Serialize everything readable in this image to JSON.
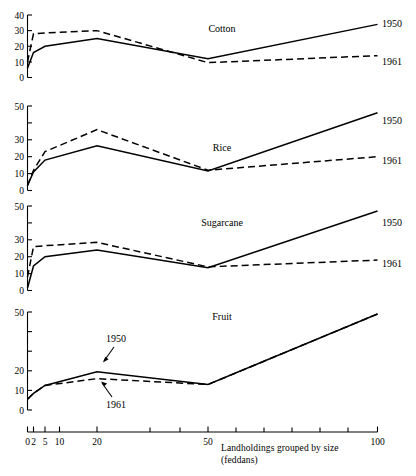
{
  "chart_data": {
    "type": "line",
    "title": "",
    "xlabel": "Landholdings grouped by size (feddans)",
    "ylabel": "",
    "x_scale": "ordinal-log",
    "grid": false,
    "legend_position": "right-end-of-line",
    "x_ticks": [
      "0",
      "2",
      "5",
      "10",
      "20",
      "50",
      "100"
    ],
    "x_tick_values": [
      0,
      2,
      5,
      10,
      20,
      50,
      100
    ],
    "panels": [
      {
        "name": "cotton",
        "title": "Cotton",
        "ylim": [
          0,
          40
        ],
        "y_ticks": [
          0,
          10,
          20,
          30,
          40
        ],
        "y_tick_labels": [
          "0",
          "10",
          "20",
          "30",
          "40"
        ],
        "x": [
          0,
          2,
          5,
          20,
          50,
          100
        ],
        "series": [
          {
            "name": "1950",
            "style": "solid",
            "label": "1950",
            "values": [
              6,
              16,
              20,
              25,
              12,
              34
            ]
          },
          {
            "name": "1961",
            "style": "dashed",
            "label": "1961",
            "values": [
              10,
              28,
              28.5,
              30,
              9.5,
              14
            ]
          }
        ]
      },
      {
        "name": "rice",
        "title": "Rice",
        "ylim": [
          0,
          50
        ],
        "y_ticks": [
          0,
          10,
          20,
          30,
          40,
          50
        ],
        "y_tick_labels": [
          "0",
          "10",
          "20",
          "30",
          "",
          "50"
        ],
        "x": [
          0,
          2,
          5,
          20,
          50,
          100
        ],
        "series": [
          {
            "name": "1950",
            "style": "solid",
            "label": "1950",
            "values": [
              3,
              11,
              18,
              26.5,
              11.5,
              46
            ]
          },
          {
            "name": "1961",
            "style": "dashed",
            "label": "1961",
            "values": [
              3,
              12,
              23,
              36,
              12,
              20
            ]
          }
        ]
      },
      {
        "name": "sugarcane",
        "title": "Sugarcane",
        "ylim": [
          0,
          50
        ],
        "y_ticks": [
          0,
          10,
          20,
          30,
          40,
          50
        ],
        "y_tick_labels": [
          "0",
          "10",
          "20",
          "30",
          "",
          "50"
        ],
        "x": [
          0,
          2,
          5,
          20,
          50,
          100
        ],
        "series": [
          {
            "name": "1950",
            "style": "solid",
            "label": "1950",
            "values": [
              1.5,
              14.5,
              20,
              24,
              13.5,
              47
            ]
          },
          {
            "name": "1961",
            "style": "dashed",
            "label": "1961",
            "values": [
              8,
              26,
              26.5,
              28.5,
              14,
              18
            ]
          }
        ]
      },
      {
        "name": "fruit",
        "title": "Fruit",
        "ylim": [
          0,
          50
        ],
        "y_ticks": [
          0,
          10,
          20,
          30,
          40,
          50
        ],
        "y_tick_labels": [
          "0",
          "10",
          "20",
          "30",
          "",
          "50"
        ],
        "x": [
          0,
          2,
          5,
          20,
          50,
          100
        ],
        "series": [
          {
            "name": "1950",
            "style": "solid",
            "label": "1950",
            "values": [
              5.5,
              8.5,
              12.5,
              19.5,
              13,
              49
            ]
          },
          {
            "name": "1961",
            "style": "dashed",
            "label": "1961",
            "values": [
              5.5,
              8.5,
              12.5,
              16,
              13,
              49
            ]
          }
        ],
        "annotations": [
          {
            "text": "1950",
            "target_series": "1950"
          },
          {
            "text": "1961",
            "target_series": "1961"
          }
        ]
      }
    ]
  }
}
